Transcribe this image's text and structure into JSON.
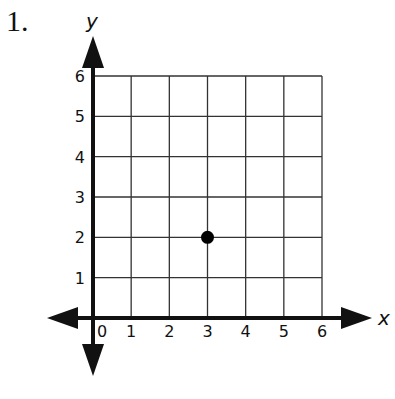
{
  "problem": {
    "number": "1."
  },
  "chart_data": {
    "type": "scatter",
    "title": "",
    "xlabel": "x",
    "ylabel": "y",
    "xlim": [
      0,
      6
    ],
    "ylim": [
      0,
      6
    ],
    "grid": true,
    "x_ticks": [
      "0",
      "1",
      "2",
      "3",
      "4",
      "5",
      "6"
    ],
    "y_ticks": [
      "1",
      "2",
      "3",
      "4",
      "5",
      "6"
    ],
    "points": [
      {
        "x": 3,
        "y": 2
      }
    ],
    "colors": {
      "axis": "#111111",
      "grid": "#333333",
      "point": "#000000"
    }
  }
}
